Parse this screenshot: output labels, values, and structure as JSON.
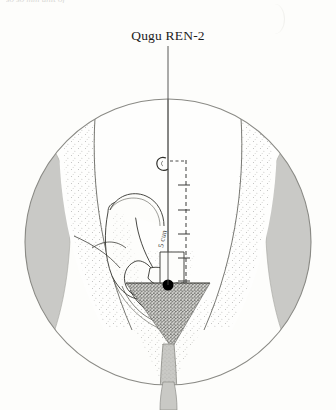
{
  "page": {
    "background_color": "#fdfdfb",
    "top_cut_text": "so so mm unit of",
    "width": 336,
    "height": 410
  },
  "label": {
    "text": "Qugu REN-2",
    "point_name_pinyin": "Qugu",
    "point_code": "REN-2"
  },
  "illustration": {
    "title": "Location of Qugu REN-2 on the lower abdomen",
    "view": "anterior view of lower abdomen and pelvis",
    "frame": {
      "shape": "circle",
      "center_x": 168,
      "center_y": 242,
      "radius": 143,
      "stroke_color": "#8a8a85"
    },
    "colors": {
      "line": "#2b2b2b",
      "thigh_shade": "#c9c9c6",
      "stipple": "#6e6e6a",
      "pubic_triangle": "#5d5d58",
      "point_marker": "#000000",
      "scale_line": "#3a3a38",
      "pointer_line": "#454543"
    },
    "point_marker": {
      "name": "REN-2 Qugu",
      "x": 168,
      "y": 285,
      "radius": 5.5,
      "style": "filled black dot"
    },
    "pointer_line": {
      "from_x": 168,
      "from_y": 46,
      "to_x": 168,
      "to_y": 285
    },
    "measurement_scale": {
      "description": "dashed cun scale from umbilicus down to the pubic symphysis",
      "units": "cun",
      "total_cun": 5,
      "tick_count": 5,
      "top_x": 186,
      "top_y": 160,
      "bottom_y": 283,
      "landmark_top": "umbilicus",
      "landmark_bottom": "superior border of pubic symphysis"
    },
    "anatomy_labels": {
      "umbilicus": "umbilicus",
      "pubic_symphysis": "pubic symphysis",
      "ilium": "ilium",
      "perineum": "perineum"
    },
    "vertical_midline": {
      "x": 168,
      "description": "anterior midline (Conception vessel)"
    }
  }
}
